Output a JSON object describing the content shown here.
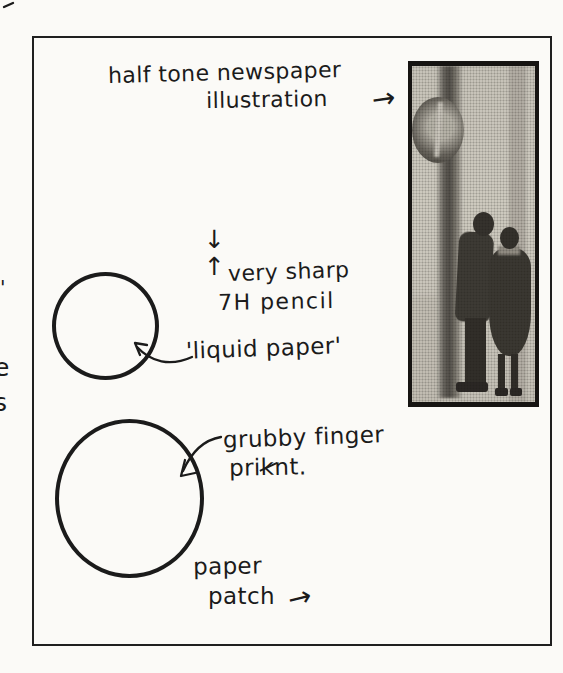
{
  "page": {
    "ink_color": "#1b1b1b",
    "paper_color": "#fbfaf7"
  },
  "labels": {
    "halftone_line1": "half tone newspaper",
    "halftone_line2": "illustration",
    "pencil_line1": "very sharp",
    "pencil_line2": "7H pencil",
    "liquid_paper": "'liquid paper'",
    "finger_line1": "grubby finger",
    "finger_pre": "pri",
    "finger_struck": "k",
    "finger_post": "nt.",
    "patch_line1": "paper",
    "patch_line2": "patch"
  },
  "symbols": {
    "arrow_right": "→",
    "arrow_down": "↓",
    "arrow_up": "↑"
  },
  "margin": {
    "fragment_mark": "'",
    "fragment_letter1": "e",
    "fragment_letter2": "s"
  },
  "photo": {
    "style": "halftone-newsprint",
    "subject": "couple standing beside a street sign pole",
    "background": "#d8d4ca",
    "border": "#161412"
  }
}
